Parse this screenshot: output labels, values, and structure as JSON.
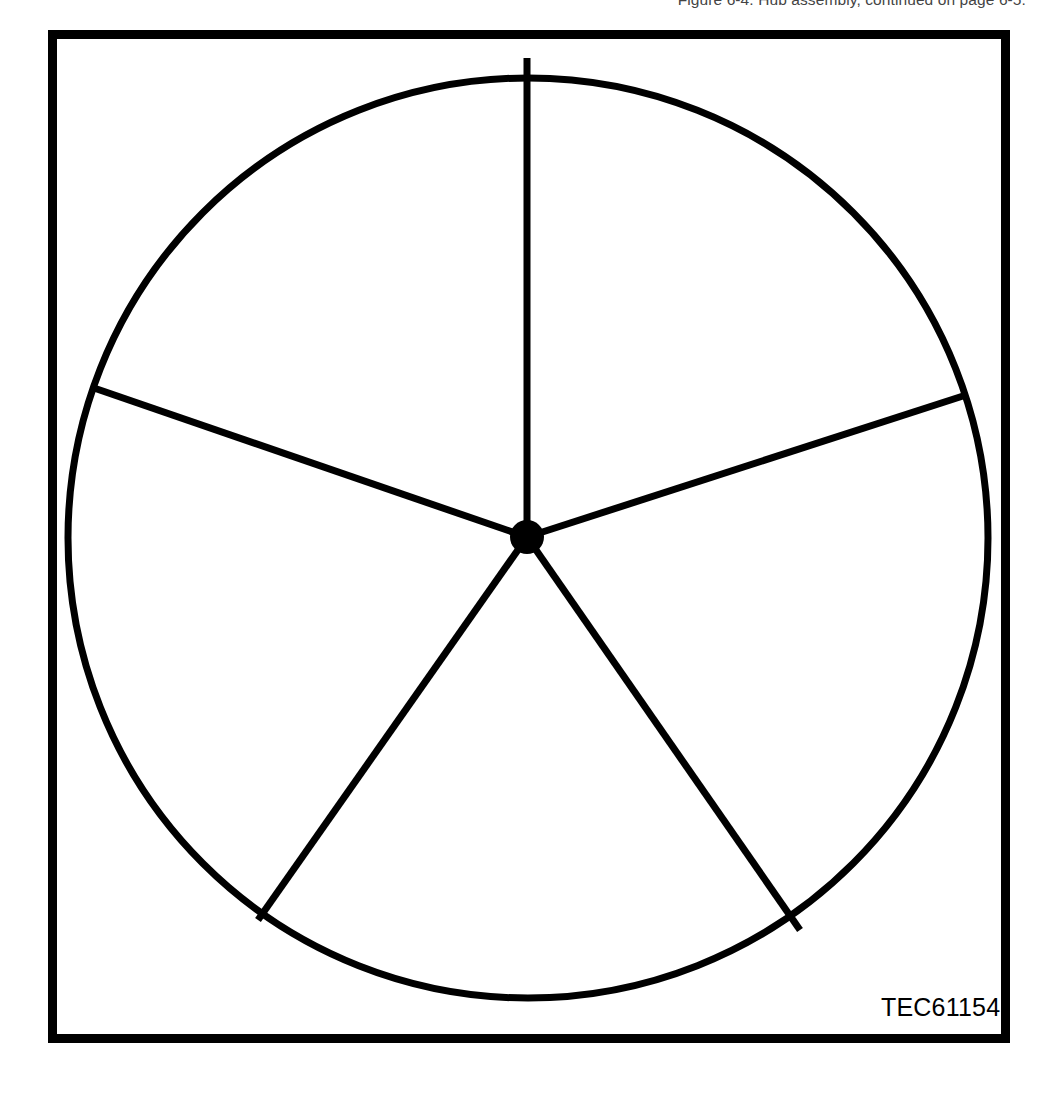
{
  "page": {
    "running_head_text": "Figure 6-4.  Hub assembly, continued on page 6-5.",
    "background_color": "#ffffff",
    "ink_color": "#000000"
  },
  "figure": {
    "part_number_label": "TEC61154",
    "frame": {
      "x": 48,
      "y": 30,
      "width": 962,
      "height": 1013,
      "border_width": 9,
      "border_color": "#000000"
    },
    "diagram": {
      "type": "spoked-wheel-five-segment",
      "circle": {
        "center_x": 528,
        "center_y": 538,
        "radius": 460,
        "stroke_width": 7,
        "stroke_color": "#000000",
        "fill": "none"
      },
      "hub": {
        "center_x": 527,
        "center_y": 537,
        "radius": 17,
        "fill_color": "#000000"
      },
      "spoke_stroke_width": 7,
      "spoke_stroke_color": "#000000",
      "spokes": [
        {
          "name": "spoke-top",
          "angle_deg": 90,
          "end_x": 527,
          "end_y": 58
        },
        {
          "name": "spoke-upper-left",
          "angle_deg": 160,
          "end_x": 94,
          "end_y": 388
        },
        {
          "name": "spoke-upper-right",
          "angle_deg": 19,
          "end_x": 963,
          "end_y": 396
        },
        {
          "name": "spoke-lower-left",
          "angle_deg": 234.5,
          "end_x": 258,
          "end_y": 920
        },
        {
          "name": "spoke-lower-right",
          "angle_deg": 304.5,
          "end_x": 800,
          "end_y": 930
        }
      ],
      "segment_count": 5
    }
  }
}
